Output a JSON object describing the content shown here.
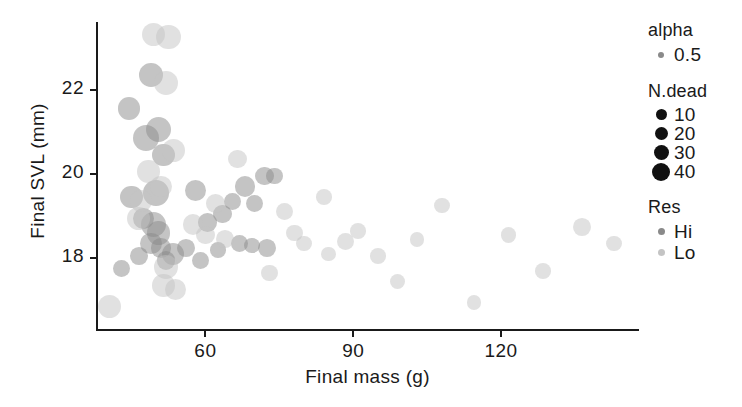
{
  "chart_data": {
    "type": "scatter",
    "title": "",
    "xlabel": "Final mass (g)",
    "ylabel": "Final SVL (mm)",
    "xticks": [
      60,
      90,
      120
    ],
    "yticks": [
      18,
      20,
      22
    ],
    "xlim": [
      38,
      148
    ],
    "ylim": [
      16.3,
      23.6
    ],
    "grid": false,
    "legend_position": "right",
    "size_variable": "N.dead",
    "size_levels": [
      10,
      20,
      30,
      40
    ],
    "color_variable": "Res",
    "color_levels": [
      "Hi",
      "Lo"
    ],
    "alpha": 0.5,
    "colors": {
      "Hi": "#8a8a8a",
      "Lo": "#c4c4c4",
      "legend_key": "#111111",
      "axis": "#1a1a1a"
    },
    "series": [
      {
        "name": "Hi",
        "color": "#8a8a8a",
        "points": [
          {
            "x": 49.0,
            "y": 22.35,
            "n_dead": 28
          },
          {
            "x": 50.5,
            "y": 21.05,
            "n_dead": 34
          },
          {
            "x": 48.0,
            "y": 20.85,
            "n_dead": 36
          },
          {
            "x": 51.5,
            "y": 20.45,
            "n_dead": 24
          },
          {
            "x": 44.5,
            "y": 21.55,
            "n_dead": 24
          },
          {
            "x": 50.0,
            "y": 19.55,
            "n_dead": 34
          },
          {
            "x": 45.0,
            "y": 19.45,
            "n_dead": 24
          },
          {
            "x": 47.5,
            "y": 18.95,
            "n_dead": 20
          },
          {
            "x": 49.5,
            "y": 18.8,
            "n_dead": 32
          },
          {
            "x": 50.5,
            "y": 18.6,
            "n_dead": 26
          },
          {
            "x": 49.0,
            "y": 18.35,
            "n_dead": 22
          },
          {
            "x": 51.0,
            "y": 18.25,
            "n_dead": 16
          },
          {
            "x": 53.5,
            "y": 18.1,
            "n_dead": 22
          },
          {
            "x": 52.0,
            "y": 17.95,
            "n_dead": 14
          },
          {
            "x": 46.5,
            "y": 18.05,
            "n_dead": 12
          },
          {
            "x": 43.0,
            "y": 17.75,
            "n_dead": 10
          },
          {
            "x": 56.0,
            "y": 18.25,
            "n_dead": 12
          },
          {
            "x": 58.0,
            "y": 19.6,
            "n_dead": 20
          },
          {
            "x": 60.5,
            "y": 18.85,
            "n_dead": 14
          },
          {
            "x": 63.5,
            "y": 19.05,
            "n_dead": 14
          },
          {
            "x": 65.5,
            "y": 19.35,
            "n_dead": 10
          },
          {
            "x": 68.0,
            "y": 19.7,
            "n_dead": 18
          },
          {
            "x": 72.0,
            "y": 19.95,
            "n_dead": 14
          },
          {
            "x": 70.0,
            "y": 19.3,
            "n_dead": 10
          },
          {
            "x": 74.0,
            "y": 19.95,
            "n_dead": 10
          },
          {
            "x": 67.0,
            "y": 18.35,
            "n_dead": 10
          },
          {
            "x": 69.5,
            "y": 18.3,
            "n_dead": 8
          },
          {
            "x": 72.5,
            "y": 18.25,
            "n_dead": 12
          },
          {
            "x": 62.5,
            "y": 18.2,
            "n_dead": 8
          },
          {
            "x": 59.0,
            "y": 17.95,
            "n_dead": 10
          }
        ]
      },
      {
        "name": "Lo",
        "color": "#c4c4c4",
        "points": [
          {
            "x": 52.5,
            "y": 23.25,
            "n_dead": 30
          },
          {
            "x": 49.5,
            "y": 23.3,
            "n_dead": 26
          },
          {
            "x": 52.0,
            "y": 22.15,
            "n_dead": 28
          },
          {
            "x": 53.5,
            "y": 20.55,
            "n_dead": 26
          },
          {
            "x": 48.5,
            "y": 20.05,
            "n_dead": 24
          },
          {
            "x": 47.0,
            "y": 19.35,
            "n_dead": 22
          },
          {
            "x": 46.5,
            "y": 18.95,
            "n_dead": 26
          },
          {
            "x": 51.0,
            "y": 19.7,
            "n_dead": 20
          },
          {
            "x": 52.0,
            "y": 17.8,
            "n_dead": 28
          },
          {
            "x": 51.5,
            "y": 17.35,
            "n_dead": 24
          },
          {
            "x": 40.5,
            "y": 16.85,
            "n_dead": 26
          },
          {
            "x": 57.5,
            "y": 18.8,
            "n_dead": 18
          },
          {
            "x": 60.0,
            "y": 18.55,
            "n_dead": 14
          },
          {
            "x": 64.0,
            "y": 18.45,
            "n_dead": 12
          },
          {
            "x": 62.0,
            "y": 19.3,
            "n_dead": 14
          },
          {
            "x": 66.5,
            "y": 20.35,
            "n_dead": 14
          },
          {
            "x": 78.0,
            "y": 18.6,
            "n_dead": 10
          },
          {
            "x": 80.0,
            "y": 18.35,
            "n_dead": 8
          },
          {
            "x": 76.0,
            "y": 19.1,
            "n_dead": 10
          },
          {
            "x": 84.0,
            "y": 19.45,
            "n_dead": 8
          },
          {
            "x": 88.5,
            "y": 18.4,
            "n_dead": 10
          },
          {
            "x": 91.0,
            "y": 18.65,
            "n_dead": 8
          },
          {
            "x": 95.0,
            "y": 18.05,
            "n_dead": 8
          },
          {
            "x": 99.0,
            "y": 17.45,
            "n_dead": 8
          },
          {
            "x": 103.0,
            "y": 18.45,
            "n_dead": 6
          },
          {
            "x": 108.0,
            "y": 19.25,
            "n_dead": 8
          },
          {
            "x": 114.5,
            "y": 16.95,
            "n_dead": 6
          },
          {
            "x": 121.5,
            "y": 18.55,
            "n_dead": 8
          },
          {
            "x": 128.5,
            "y": 17.7,
            "n_dead": 8
          },
          {
            "x": 136.5,
            "y": 18.75,
            "n_dead": 12
          },
          {
            "x": 143.0,
            "y": 18.35,
            "n_dead": 8
          },
          {
            "x": 85.0,
            "y": 18.1,
            "n_dead": 6
          },
          {
            "x": 73.0,
            "y": 17.65,
            "n_dead": 10
          },
          {
            "x": 54.0,
            "y": 17.25,
            "n_dead": 20
          }
        ]
      }
    ]
  },
  "axes": {
    "ylabel": "Final SVL (mm)",
    "xlabel": "Final mass (g)",
    "yticks": [
      "22",
      "20",
      "18"
    ],
    "xticks": [
      "60",
      "90",
      "120"
    ]
  },
  "legend": {
    "alpha": {
      "title": "alpha",
      "items": [
        {
          "label": "0.5",
          "size": 6,
          "color": "#8a8a8a"
        }
      ]
    },
    "ndead": {
      "title": "N.dead",
      "items": [
        {
          "label": "10",
          "size": 11,
          "color": "#111111"
        },
        {
          "label": "20",
          "size": 13,
          "color": "#111111"
        },
        {
          "label": "30",
          "size": 15,
          "color": "#111111"
        },
        {
          "label": "40",
          "size": 18,
          "color": "#111111"
        }
      ]
    },
    "res": {
      "title": "Res",
      "items": [
        {
          "label": "Hi",
          "size": 7,
          "color": "#8a8a8a"
        },
        {
          "label": "Lo",
          "size": 7,
          "color": "#c4c4c4"
        }
      ]
    }
  }
}
